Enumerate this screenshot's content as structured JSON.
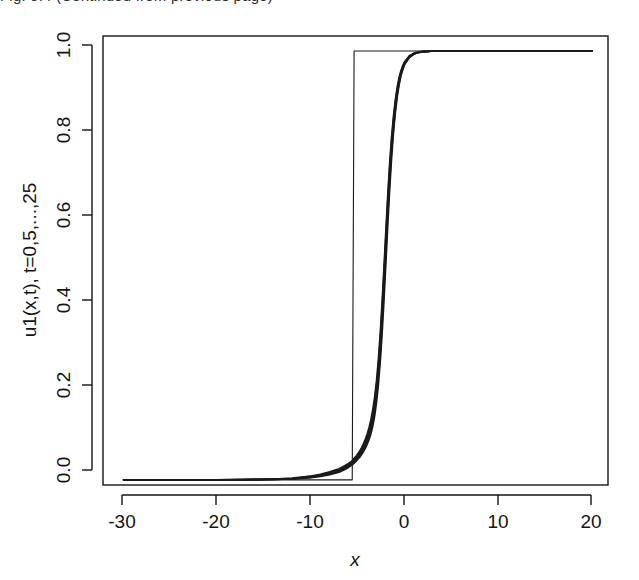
{
  "figure": {
    "caption_remnant": "Fig. 9.4 (Continued from previous page)",
    "background_color": "#ffffff",
    "line_color": "#1a1a1a",
    "axis_color": "#141414"
  },
  "axes": {
    "x_title": "x",
    "y_title": "u1(x,t), t=0,5,...,25",
    "x_ticks": [
      "-30",
      "-20",
      "-10",
      "0",
      "10",
      "20"
    ],
    "y_ticks": [
      "0.0",
      "0.2",
      "0.4",
      "0.6",
      "0.8",
      "1.0"
    ]
  },
  "chart_data": {
    "type": "line",
    "title": "",
    "subtitle": "",
    "xlabel": "x",
    "ylabel": "u1(x,t), t=0,5,...,25",
    "xlim": [
      -32.2,
      21.7
    ],
    "ylim": [
      -0.012,
      1.035
    ],
    "x_ticks": [
      -30,
      -20,
      -10,
      0,
      10,
      20
    ],
    "y_ticks": [
      0.0,
      0.2,
      0.4,
      0.6,
      0.8,
      1.0
    ],
    "grid": false,
    "legend": null,
    "legend_position": "none",
    "annotations": [],
    "x": [
      -30,
      -28,
      -26,
      -24,
      -22,
      -20,
      -18,
      -16,
      -14,
      -12,
      -10,
      -9,
      -8,
      -7,
      -6.5,
      -6,
      -5.8,
      -5.6,
      -5.4,
      -5.2,
      -5,
      -4.8,
      -4.6,
      -4.4,
      -4.2,
      -4,
      -3.8,
      -3.6,
      -3.4,
      -3.2,
      -3,
      -2.8,
      -2.6,
      -2.4,
      -2.2,
      -2,
      -1.8,
      -1.6,
      -1.4,
      -1.2,
      -1,
      -0.8,
      -0.6,
      -0.4,
      -0.2,
      0,
      0.5,
      1,
      1.5,
      2,
      2.5,
      3,
      4,
      5,
      6,
      8,
      10,
      12,
      14,
      16,
      18,
      20
    ],
    "series": [
      {
        "name": "t=0",
        "note": "sharp step initial condition rising at x = -5.9",
        "values": [
          0,
          0,
          0,
          0,
          0,
          0,
          0,
          0,
          0,
          0,
          0,
          0,
          0,
          0,
          0,
          0,
          0,
          0,
          1,
          1,
          1,
          1,
          1,
          1,
          1,
          1,
          1,
          1,
          1,
          1,
          1,
          1,
          1,
          1,
          1,
          1,
          1,
          1,
          1,
          1,
          1,
          1,
          1,
          1,
          1,
          1,
          1,
          1,
          1,
          1,
          1,
          1,
          1,
          1,
          1,
          1,
          1,
          1,
          1,
          1,
          1,
          1
        ]
      },
      {
        "name": "t=5",
        "values": [
          0.0,
          0.0,
          0.0,
          0.0,
          0.0,
          0.0,
          0.0,
          0.0,
          0.001,
          0.002,
          0.005,
          0.008,
          0.012,
          0.018,
          0.023,
          0.029,
          0.032,
          0.035,
          0.039,
          0.043,
          0.048,
          0.053,
          0.059,
          0.066,
          0.074,
          0.083,
          0.094,
          0.108,
          0.126,
          0.15,
          0.182,
          0.224,
          0.278,
          0.345,
          0.424,
          0.51,
          0.597,
          0.679,
          0.75,
          0.809,
          0.856,
          0.893,
          0.921,
          0.942,
          0.957,
          0.969,
          0.985,
          0.993,
          0.997,
          0.998,
          0.999,
          1.0,
          1.0,
          1.0,
          1.0,
          1.0,
          1.0,
          1.0,
          1.0,
          1.0,
          1.0,
          1.0
        ]
      },
      {
        "name": "t=10",
        "values": [
          0.0,
          0.0,
          0.0,
          0.0,
          0.0,
          0.0,
          0.0,
          0.0,
          0.001,
          0.002,
          0.006,
          0.009,
          0.014,
          0.02,
          0.025,
          0.031,
          0.034,
          0.038,
          0.042,
          0.046,
          0.051,
          0.057,
          0.064,
          0.071,
          0.08,
          0.09,
          0.102,
          0.118,
          0.138,
          0.164,
          0.198,
          0.243,
          0.3,
          0.37,
          0.45,
          0.536,
          0.62,
          0.698,
          0.765,
          0.82,
          0.864,
          0.899,
          0.925,
          0.945,
          0.959,
          0.97,
          0.986,
          0.993,
          0.997,
          0.998,
          0.999,
          1.0,
          1.0,
          1.0,
          1.0,
          1.0,
          1.0,
          1.0,
          1.0,
          1.0,
          1.0,
          1.0
        ]
      },
      {
        "name": "t=15",
        "values": [
          0.0,
          0.0,
          0.0,
          0.0,
          0.0,
          0.0,
          0.0,
          0.001,
          0.001,
          0.003,
          0.007,
          0.01,
          0.015,
          0.022,
          0.027,
          0.033,
          0.036,
          0.04,
          0.044,
          0.049,
          0.054,
          0.06,
          0.067,
          0.075,
          0.085,
          0.096,
          0.109,
          0.126,
          0.147,
          0.175,
          0.21,
          0.257,
          0.316,
          0.388,
          0.469,
          0.555,
          0.638,
          0.714,
          0.779,
          0.831,
          0.872,
          0.905,
          0.93,
          0.948,
          0.961,
          0.971,
          0.987,
          0.994,
          0.997,
          0.999,
          0.999,
          1.0,
          1.0,
          1.0,
          1.0,
          1.0,
          1.0,
          1.0,
          1.0,
          1.0,
          1.0,
          1.0
        ]
      },
      {
        "name": "t=20",
        "values": [
          0.0,
          0.0,
          0.0,
          0.0,
          0.0,
          0.0,
          0.0,
          0.001,
          0.002,
          0.003,
          0.008,
          0.011,
          0.017,
          0.024,
          0.029,
          0.035,
          0.038,
          0.042,
          0.047,
          0.052,
          0.057,
          0.063,
          0.07,
          0.079,
          0.089,
          0.101,
          0.115,
          0.133,
          0.155,
          0.184,
          0.221,
          0.269,
          0.33,
          0.403,
          0.485,
          0.57,
          0.652,
          0.727,
          0.789,
          0.839,
          0.879,
          0.91,
          0.934,
          0.951,
          0.963,
          0.973,
          0.988,
          0.994,
          0.997,
          0.999,
          0.999,
          1.0,
          1.0,
          1.0,
          1.0,
          1.0,
          1.0,
          1.0,
          1.0,
          1.0,
          1.0,
          1.0
        ]
      },
      {
        "name": "t=25",
        "values": [
          0.0,
          0.0,
          0.0,
          0.0,
          0.0,
          0.0,
          0.001,
          0.001,
          0.002,
          0.004,
          0.009,
          0.013,
          0.019,
          0.026,
          0.032,
          0.038,
          0.041,
          0.045,
          0.05,
          0.055,
          0.061,
          0.067,
          0.075,
          0.084,
          0.095,
          0.107,
          0.122,
          0.141,
          0.164,
          0.194,
          0.232,
          0.282,
          0.344,
          0.418,
          0.5,
          0.585,
          0.666,
          0.739,
          0.799,
          0.847,
          0.885,
          0.915,
          0.938,
          0.954,
          0.966,
          0.975,
          0.989,
          0.995,
          0.998,
          0.999,
          0.999,
          1.0,
          1.0,
          1.0,
          1.0,
          1.0,
          1.0,
          1.0,
          1.0,
          1.0,
          1.0,
          1.0
        ]
      }
    ]
  },
  "geometry": {
    "plot_left_px": 103,
    "plot_right_px": 608,
    "plot_top_px": 36,
    "plot_bottom_px": 485
  }
}
